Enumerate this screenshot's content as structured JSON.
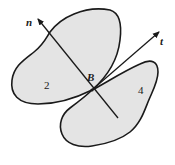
{
  "diagram": {
    "body_left": {
      "label": "2"
    },
    "body_right": {
      "label": "4"
    },
    "contact_point": {
      "label": "B"
    },
    "axes": [
      {
        "name": "normal",
        "label": "n"
      },
      {
        "name": "tangent",
        "label": "t"
      }
    ],
    "colors": {
      "fill": "#e4e4e4",
      "stroke": "#1a1a1a"
    }
  }
}
